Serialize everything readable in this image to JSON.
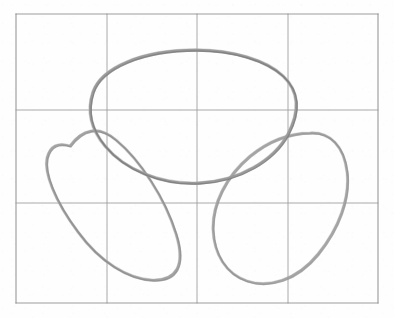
{
  "figure": {
    "kind": "hand-drawn-sketch",
    "medium": "pencil-on-grid-paper",
    "title": "",
    "caption": "",
    "background_color": "#fefefe",
    "width": 394,
    "height": 318
  },
  "grid": {
    "name": "grid-paper-rule",
    "stroke_color": "#9b9b9b",
    "border_color": "#8d8d8d",
    "stroke_width": 1,
    "columns": 4,
    "rows": 3,
    "x_lines": [
      16,
      107,
      197,
      288,
      378
    ],
    "y_lines": [
      14,
      110,
      203,
      303
    ],
    "left": 16,
    "top": 14,
    "right": 378,
    "bottom": 303,
    "cell_width": 90,
    "cell_height": 96
  },
  "chart_data": {
    "type": "scatter",
    "title": "",
    "xlabel": "",
    "ylabel": "",
    "grid": true,
    "legend": "none",
    "xlim": [
      16,
      378
    ],
    "ylim": [
      14,
      303
    ],
    "series": [
      {
        "name": "top-ellipse",
        "shape": "ellipse",
        "center": [
          193,
          116
        ],
        "rx": 104,
        "ry": 66,
        "rotation_deg": -3,
        "stroke": "#9a9a9a",
        "stroke_width": 2.4,
        "extents": {
          "left": 89,
          "right": 297,
          "top": 50,
          "bottom": 183
        }
      },
      {
        "name": "left-ellipse",
        "shape": "ellipse",
        "center": [
          112,
          219
        ],
        "rx": 80,
        "ry": 44,
        "rotation_deg": -58,
        "stroke": "#a0a0a0",
        "stroke_width": 2.2,
        "extents": {
          "left": 41,
          "right": 182,
          "top": 127,
          "bottom": 281
        }
      },
      {
        "name": "right-ellipse",
        "shape": "ellipse",
        "center": [
          281,
          211
        ],
        "rx": 82,
        "ry": 47,
        "rotation_deg": 52,
        "stroke": "#a3a3a3",
        "stroke_width": 2.2,
        "extents": {
          "left": 212,
          "right": 349,
          "top": 132,
          "bottom": 283
        }
      }
    ],
    "annotations": [
      {
        "name": "arrangement",
        "text": "three overlapping ellipses in trefoil rotational symmetry"
      }
    ]
  },
  "colors": {
    "pencil_dark": "#8f8f8f",
    "pencil_mid": "#a0a0a0",
    "pencil_light": "#b4b4b4",
    "grid": "#9b9b9b",
    "paper": "#fefefe"
  }
}
